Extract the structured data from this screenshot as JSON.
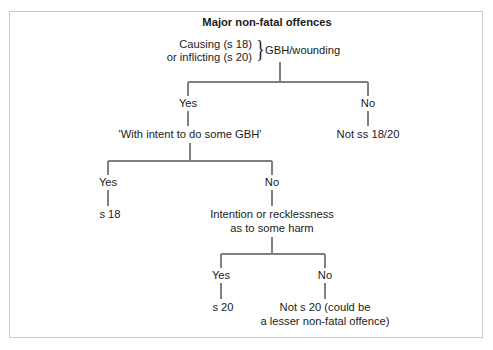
{
  "diagram": {
    "title": "Major non-fatal offences",
    "type": "decision-flowchart",
    "frame_color": "#c9c9c9",
    "line_color": "#808080",
    "text_color": "#1b1b1b",
    "root": {
      "premise_line1": "Causing (s 18)",
      "premise_line2": "or inflicting (s 20)",
      "brace": "}",
      "question": "GBH/wounding"
    },
    "level1": {
      "yes_label": "Yes",
      "no_label": "No",
      "yes_result": "'With intent to do some GBH'",
      "no_result": "Not ss 18/20"
    },
    "level2": {
      "yes_label": "Yes",
      "no_label": "No",
      "yes_result": "s 18",
      "no_result_line1": "Intention or recklessness",
      "no_result_line2": "as to some harm"
    },
    "level3": {
      "yes_label": "Yes",
      "no_label": "No",
      "yes_result": "s 20",
      "no_result_line1": "Not s 20 (could be",
      "no_result_line2": "a lesser non-fatal offence)"
    }
  }
}
